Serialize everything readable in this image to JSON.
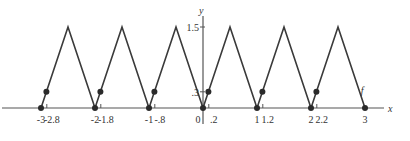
{
  "chart_data": {
    "type": "line",
    "title": "",
    "xlabel": "x",
    "ylabel": "y",
    "function_label": "f",
    "series": [
      {
        "name": "f",
        "x": [
          -3,
          -2.5,
          -2,
          -1.5,
          -1,
          -0.5,
          0,
          0.5,
          1,
          1.5,
          2,
          2.5,
          3
        ],
        "y": [
          0,
          1.5,
          0,
          1.5,
          0,
          1.5,
          0,
          1.5,
          0,
          1.5,
          0,
          1.5,
          0
        ]
      }
    ],
    "points_on_axis": {
      "x": [
        -3,
        -2,
        -1,
        0,
        1,
        2,
        3
      ],
      "y": [
        0,
        0,
        0,
        0,
        0,
        0,
        0
      ]
    },
    "points_on_curve": {
      "x": [
        -2.9,
        -1.9,
        -0.9,
        0.1,
        1.1,
        2.1
      ],
      "y": [
        0.3,
        0.3,
        0.3,
        0.3,
        0.3,
        0.3
      ]
    },
    "x_tick_labels": [
      {
        "value": -3,
        "label": "-3"
      },
      {
        "value": -2.8,
        "label": "-2.8"
      },
      {
        "value": -2,
        "label": "-2"
      },
      {
        "value": -1.8,
        "label": "-1.8"
      },
      {
        "value": -1,
        "label": "-1"
      },
      {
        "value": -0.8,
        "label": "-.8"
      },
      {
        "value": 0,
        "label": "0"
      },
      {
        "value": 0.2,
        "label": ".2"
      },
      {
        "value": 1,
        "label": "1"
      },
      {
        "value": 1.2,
        "label": "1.2"
      },
      {
        "value": 2,
        "label": "2"
      },
      {
        "value": 2.2,
        "label": "2.2"
      },
      {
        "value": 3,
        "label": "3"
      }
    ],
    "y_tick_labels": [
      {
        "value": 0.3,
        "label": ".3"
      },
      {
        "value": 1.5,
        "label": "1.5"
      }
    ],
    "xlim": [
      -3.7,
      3.6
    ],
    "ylim": [
      -0.5,
      2.0
    ],
    "grid": false,
    "legend": "none"
  },
  "style": {
    "line_color": "#3a3a3a",
    "axis_color": "#555555",
    "point_color": "#2a2a2a"
  }
}
